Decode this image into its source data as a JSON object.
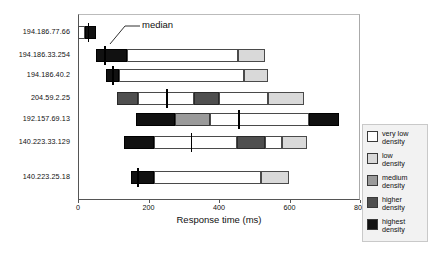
{
  "chart_data": {
    "type": "bar",
    "title": "",
    "subtitle": "",
    "xlabel": "Response time (ms)",
    "ylabel": "",
    "xlim": [
      0,
      800
    ],
    "xticks": [
      0,
      200,
      400,
      600,
      800
    ],
    "xtick_labels": [
      "0",
      "200",
      "400",
      "600",
      "800"
    ],
    "grid": false,
    "legend_position": "right",
    "orientation": "horizontal",
    "stacked": true,
    "annotations": [
      {
        "text": "median",
        "points_to_series": "194.186.33.254",
        "value": 75
      }
    ],
    "density_levels": [
      {
        "key": "very_low",
        "label": "very low\ndensity",
        "color": "#ffffff"
      },
      {
        "key": "low",
        "label": "low\ndensity",
        "color": "#d9d9d9"
      },
      {
        "key": "medium",
        "label": "medium\ndensity",
        "color": "#9a9a9a"
      },
      {
        "key": "higher",
        "label": "higher\ndensity",
        "color": "#4f4f4f"
      },
      {
        "key": "highest",
        "label": "highest\ndensity",
        "color": "#111111"
      }
    ],
    "categories": [
      "194.186.77.66",
      "194.186.33.254",
      "194.186.40.2",
      "204.59.2.25",
      "192.157.69.13",
      "140.223.33.129",
      "140.223.25.18"
    ],
    "rows": [
      {
        "category": "194.186.77.66",
        "start": 0,
        "end": 50,
        "median": 28,
        "segments": [
          {
            "from": 0,
            "to": 20,
            "density": "very_low"
          },
          {
            "from": 20,
            "to": 50,
            "density": "highest"
          }
        ]
      },
      {
        "category": "194.186.33.254",
        "start": 52,
        "end": 530,
        "median": 75,
        "segments": [
          {
            "from": 52,
            "to": 140,
            "density": "highest"
          },
          {
            "from": 140,
            "to": 455,
            "density": "very_low"
          },
          {
            "from": 455,
            "to": 530,
            "density": "low"
          }
        ]
      },
      {
        "category": "194.186.40.2",
        "start": 80,
        "end": 540,
        "median": 97,
        "segments": [
          {
            "from": 80,
            "to": 115,
            "density": "highest"
          },
          {
            "from": 115,
            "to": 470,
            "density": "very_low"
          },
          {
            "from": 470,
            "to": 540,
            "density": "low"
          }
        ]
      },
      {
        "category": "204.59.2.25",
        "start": 110,
        "end": 640,
        "median": 250,
        "segments": [
          {
            "from": 110,
            "to": 170,
            "density": "higher"
          },
          {
            "from": 170,
            "to": 330,
            "density": "very_low"
          },
          {
            "from": 330,
            "to": 400,
            "density": "higher"
          },
          {
            "from": 400,
            "to": 540,
            "density": "very_low"
          },
          {
            "from": 540,
            "to": 640,
            "density": "low"
          }
        ]
      },
      {
        "category": "192.157.69.13",
        "start": 165,
        "end": 740,
        "median": 455,
        "segments": [
          {
            "from": 165,
            "to": 275,
            "density": "highest"
          },
          {
            "from": 275,
            "to": 375,
            "density": "medium"
          },
          {
            "from": 375,
            "to": 655,
            "density": "very_low"
          },
          {
            "from": 655,
            "to": 740,
            "density": "highest"
          }
        ]
      },
      {
        "category": "140.223.33.129",
        "start": 130,
        "end": 650,
        "median": 320,
        "segments": [
          {
            "from": 130,
            "to": 215,
            "density": "highest"
          },
          {
            "from": 215,
            "to": 450,
            "density": "very_low"
          },
          {
            "from": 450,
            "to": 530,
            "density": "higher"
          },
          {
            "from": 530,
            "to": 580,
            "density": "very_low"
          },
          {
            "from": 580,
            "to": 650,
            "density": "low"
          }
        ]
      },
      {
        "category": "140.223.25.18",
        "start": 150,
        "end": 600,
        "median": 168,
        "segments": [
          {
            "from": 150,
            "to": 215,
            "density": "highest"
          },
          {
            "from": 215,
            "to": 520,
            "density": "very_low"
          },
          {
            "from": 520,
            "to": 600,
            "density": "low"
          }
        ]
      }
    ]
  },
  "legend": {
    "items": [
      {
        "label": "very low\ndensity"
      },
      {
        "label": "low\ndensity"
      },
      {
        "label": "medium\ndensity"
      },
      {
        "label": "higher\ndensity"
      },
      {
        "label": "highest\ndensity"
      }
    ]
  },
  "annotation": {
    "median_label": "median"
  },
  "axis": {
    "x_title": "Response time (ms)"
  }
}
